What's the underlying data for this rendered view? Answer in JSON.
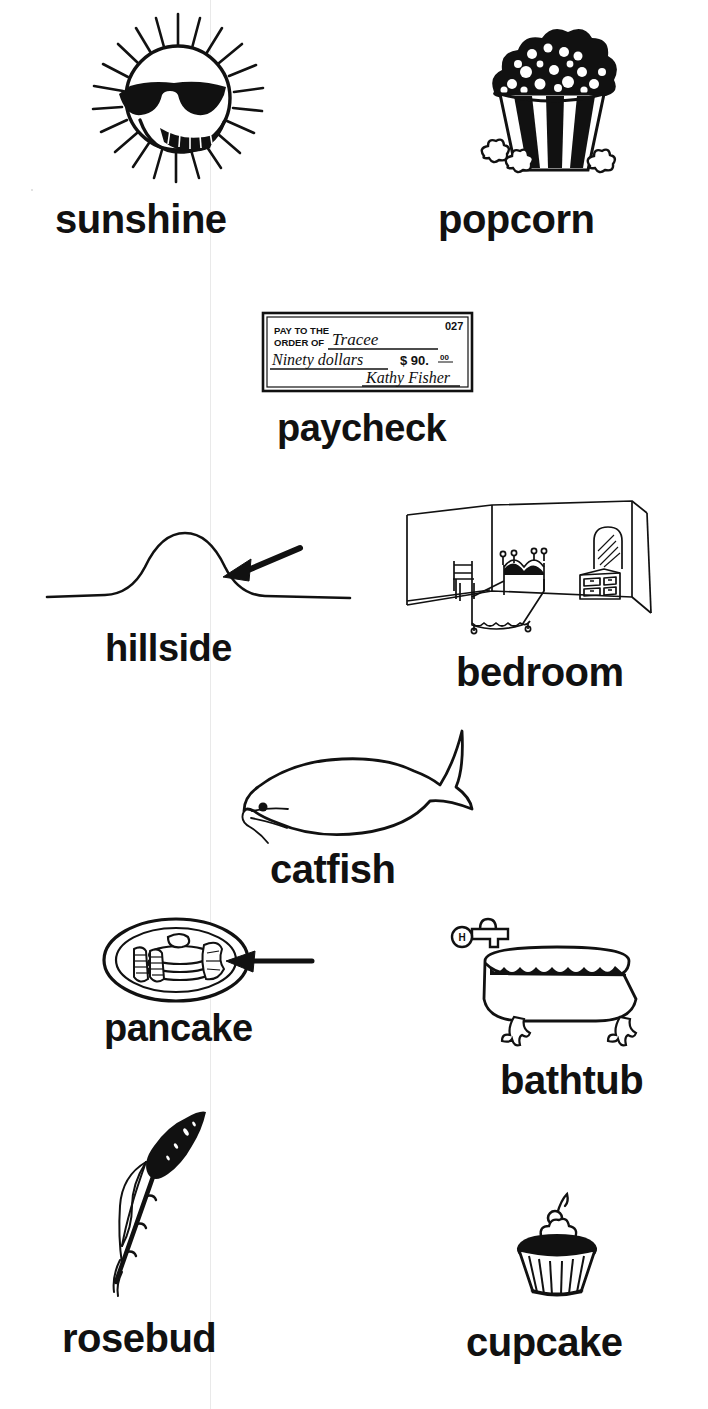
{
  "page": {
    "background_color": "#ffffff",
    "ink_color": "#111111",
    "fold_line_color": "#e9e9e9",
    "width": 708,
    "height": 1409
  },
  "items": [
    {
      "id": "sunshine",
      "label": "sunshine",
      "icon": "sun-with-sunglasses-drawing",
      "label_x": 55,
      "label_y": 199,
      "label_size": 40,
      "art_x": 88,
      "art_y": 8,
      "art_w": 180,
      "art_h": 180
    },
    {
      "id": "popcorn",
      "label": "popcorn",
      "icon": "popcorn-bucket-drawing",
      "label_x": 438,
      "label_y": 199,
      "label_size": 40,
      "art_x": 470,
      "art_y": 20,
      "art_w": 160,
      "art_h": 165
    },
    {
      "id": "paycheck",
      "label": "paycheck",
      "icon": "bank-check-drawing",
      "label_x": 277,
      "label_y": 409,
      "label_size": 38,
      "art_x": 260,
      "art_y": 310,
      "art_w": 215,
      "art_h": 85
    },
    {
      "id": "hillside",
      "label": "hillside",
      "icon": "hill-with-arrow-drawing",
      "label_x": 105,
      "label_y": 629,
      "label_size": 38,
      "art_x": 45,
      "art_y": 515,
      "art_w": 310,
      "art_h": 100
    },
    {
      "id": "bedroom",
      "label": "bedroom",
      "icon": "bedroom-interior-drawing",
      "label_x": 456,
      "label_y": 652,
      "label_size": 40,
      "art_x": 404,
      "art_y": 495,
      "art_w": 250,
      "art_h": 140
    },
    {
      "id": "catfish",
      "label": "catfish",
      "icon": "catfish-drawing",
      "label_x": 270,
      "label_y": 849,
      "label_size": 40,
      "art_x": 230,
      "art_y": 725,
      "art_w": 230,
      "art_h": 125
    },
    {
      "id": "pancake",
      "label": "pancake",
      "icon": "pancake-plate-with-arrow-drawing",
      "label_x": 104,
      "label_y": 1009,
      "label_size": 38,
      "art_x": 100,
      "art_y": 915,
      "art_w": 215,
      "art_h": 90
    },
    {
      "id": "bathtub",
      "label": "bathtub",
      "icon": "clawfoot-bathtub-drawing",
      "label_x": 500,
      "label_y": 1060,
      "label_size": 40,
      "art_x": 440,
      "art_y": 905,
      "art_w": 235,
      "art_h": 140
    },
    {
      "id": "rosebud",
      "label": "rosebud",
      "icon": "rosebud-stem-drawing",
      "label_x": 62,
      "label_y": 1318,
      "label_size": 40,
      "art_x": 110,
      "art_y": 1110,
      "art_w": 125,
      "art_h": 190
    },
    {
      "id": "cupcake",
      "label": "cupcake",
      "icon": "cupcake-with-cherry-drawing",
      "label_x": 466,
      "label_y": 1322,
      "label_size": 40,
      "art_x": 505,
      "art_y": 1192,
      "art_w": 105,
      "art_h": 110
    }
  ],
  "paycheck_detail": {
    "line1": "PAY TO THE",
    "line2": "ORDER OF",
    "payee": "Tracee",
    "amount_words": "Ninety dollars",
    "amount_figures": "$ 90.",
    "amount_cents": "00",
    "signature": "Kathy Fisher",
    "check_number": "027"
  },
  "bathtub_detail": {
    "faucet_handle_label": "H"
  }
}
